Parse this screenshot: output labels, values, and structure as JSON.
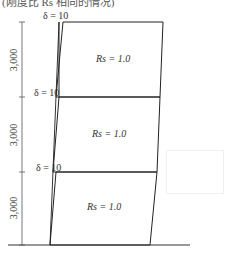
{
  "caption": "(刚度比 Rs 相同的情况)",
  "stories": [
    {
      "label": "Rs = 1.0",
      "drift_label": "δ = 10",
      "height_label": "3,000"
    },
    {
      "label": "Rs = 1.0",
      "drift_label": "δ = 10",
      "height_label": "3,000"
    },
    {
      "label": "Rs = 1.0",
      "drift_label": "δ = 10",
      "height_label": "3,000"
    }
  ],
  "watermark": "",
  "colors": {
    "line": "#222222",
    "text": "#333333"
  }
}
